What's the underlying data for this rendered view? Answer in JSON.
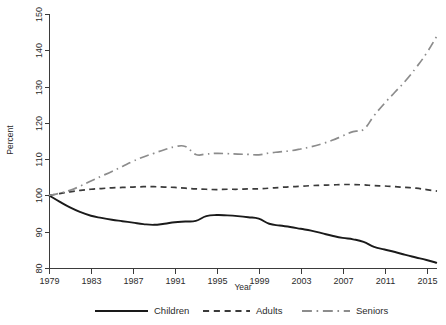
{
  "chart_data": {
    "type": "line",
    "title": "",
    "xlabel": "Year",
    "ylabel": "Percent",
    "xlim": [
      1979,
      2016
    ],
    "ylim": [
      80,
      150
    ],
    "grid": false,
    "legend_position": "bottom",
    "xticks": [
      1979,
      1983,
      1987,
      1991,
      1995,
      1999,
      2003,
      2007,
      2011,
      2015
    ],
    "yticks": [
      80,
      90,
      100,
      110,
      120,
      130,
      140,
      150
    ],
    "x": [
      1979,
      1980,
      1981,
      1982,
      1983,
      1984,
      1985,
      1986,
      1987,
      1988,
      1989,
      1990,
      1991,
      1992,
      1993,
      1994,
      1995,
      1996,
      1997,
      1998,
      1999,
      2000,
      2001,
      2002,
      2003,
      2004,
      2005,
      2006,
      2007,
      2008,
      2009,
      2010,
      2011,
      2012,
      2013,
      2014,
      2015,
      2016
    ],
    "series": [
      {
        "name": "Children",
        "style": "solid",
        "color": "#1a1a1a",
        "values": [
          100.0,
          98.3,
          96.7,
          95.4,
          94.4,
          93.8,
          93.3,
          92.9,
          92.5,
          92.1,
          91.9,
          92.2,
          92.6,
          92.8,
          93.0,
          94.3,
          94.6,
          94.5,
          94.3,
          94.0,
          93.6,
          92.2,
          91.7,
          91.3,
          90.8,
          90.3,
          89.6,
          88.9,
          88.3,
          87.9,
          87.2,
          85.8,
          85.1,
          84.4,
          83.6,
          82.9,
          82.2,
          81.4
        ]
      },
      {
        "name": "Adults",
        "style": "dashed",
        "color": "#3a3a3a",
        "values": [
          100.0,
          100.5,
          101.0,
          101.4,
          101.7,
          101.9,
          102.1,
          102.2,
          102.3,
          102.4,
          102.4,
          102.3,
          102.2,
          102.0,
          101.8,
          101.7,
          101.6,
          101.7,
          101.7,
          101.8,
          101.8,
          102.0,
          102.2,
          102.4,
          102.5,
          102.7,
          102.8,
          102.9,
          103.0,
          103.0,
          102.9,
          102.7,
          102.6,
          102.4,
          102.2,
          102.0,
          101.6,
          101.2
        ]
      },
      {
        "name": "Seniors",
        "style": "dashdot",
        "color": "#8c8c8c",
        "values": [
          100.0,
          100.6,
          101.4,
          102.6,
          104.0,
          105.3,
          106.6,
          108.0,
          109.4,
          110.6,
          111.6,
          112.6,
          113.4,
          113.5,
          111.3,
          111.4,
          111.6,
          111.5,
          111.4,
          111.3,
          111.2,
          111.7,
          112.0,
          112.3,
          112.8,
          113.4,
          114.2,
          115.2,
          116.4,
          117.6,
          118.2,
          122.0,
          125.4,
          128.5,
          131.6,
          135.2,
          139.2,
          144.0
        ]
      }
    ],
    "legend": [
      {
        "label": "Children",
        "style": "solid",
        "color": "#1a1a1a"
      },
      {
        "label": "Adults",
        "style": "dashed",
        "color": "#3a3a3a"
      },
      {
        "label": "Seniors",
        "style": "dashdot",
        "color": "#8c8c8c"
      }
    ]
  }
}
